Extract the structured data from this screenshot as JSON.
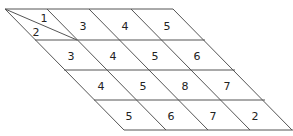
{
  "grid": {
    "rows": [
      [
        "3",
        "4",
        "5"
      ],
      [
        "3",
        "4",
        "5",
        "6"
      ],
      [
        "4",
        "5",
        "8",
        "7"
      ],
      [
        "5",
        "6",
        "7",
        "2"
      ]
    ],
    "corner_cell": {
      "upper": "1",
      "lower": "2"
    }
  }
}
